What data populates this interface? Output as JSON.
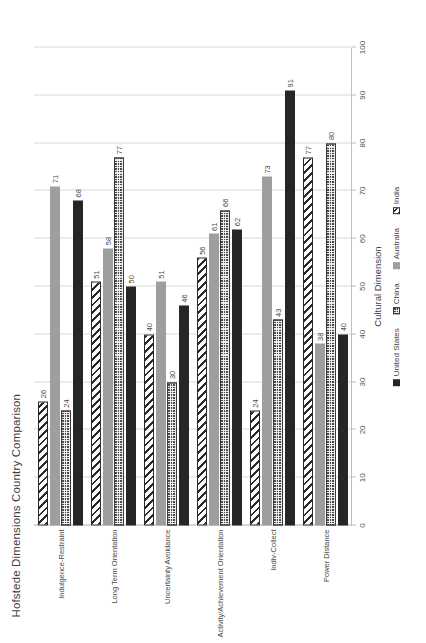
{
  "chart_data": {
    "type": "bar",
    "orientation": "horizontal",
    "title": "Hofstede Dimensions Country Comparison",
    "xlabel": "",
    "ylabel": "Cultural Dimension",
    "xlim": [
      0,
      100
    ],
    "xticks": [
      0,
      10,
      20,
      30,
      40,
      50,
      60,
      70,
      80,
      90,
      100
    ],
    "grid": true,
    "legend_position": "bottom",
    "categories": [
      "Power Distance",
      "Indiv-Collect",
      "Activity/Achievement Orientation",
      "Uncertainty Avoidance",
      "Long Term Orientation",
      "Indulgence-Restraint"
    ],
    "series": [
      {
        "name": "United States",
        "color": "#262626",
        "pattern": "solid",
        "values": [
          40,
          91,
          62,
          46,
          50,
          68
        ]
      },
      {
        "name": "China",
        "color": "#4a4a4a",
        "pattern": "crosshatch",
        "values": [
          80,
          43,
          66,
          30,
          77,
          24
        ]
      },
      {
        "name": "Australia",
        "color": "#9e9e9e",
        "pattern": "solid",
        "values": [
          38,
          73,
          61,
          51,
          58,
          71
        ]
      },
      {
        "name": "India",
        "color": "#2b2b2b",
        "pattern": "diagonal",
        "values": [
          77,
          24,
          56,
          40,
          51,
          26
        ]
      }
    ]
  },
  "axis": {
    "y_title": "Cultural Dimension",
    "tick_labels": [
      "0",
      "10",
      "20",
      "30",
      "40",
      "50",
      "60",
      "70",
      "80",
      "90",
      "100"
    ]
  },
  "legend": {
    "items": [
      {
        "label": "United States",
        "key": "us"
      },
      {
        "label": "China",
        "key": "cn"
      },
      {
        "label": "Australia",
        "key": "au"
      },
      {
        "label": "India",
        "key": "in"
      }
    ]
  }
}
